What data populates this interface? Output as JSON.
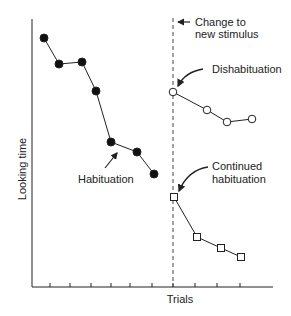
{
  "chart_data": {
    "type": "line",
    "title": "",
    "xlabel": "Trials",
    "ylabel": "Looking time",
    "grid": false,
    "legend": null,
    "x_ticks_count": 10,
    "x_tick_labels": [],
    "y_tick_labels": [],
    "series": [
      {
        "name": "Habituation (original stimulus)",
        "marker": "filled-circle",
        "x": [
          1,
          2,
          3,
          4,
          5,
          6,
          7
        ],
        "values": [
          38,
          64,
          62,
          91,
          142,
          152,
          174
        ]
      },
      {
        "name": "Dishabituation (new stimulus)",
        "marker": "open-circle",
        "x": [
          8,
          9,
          10,
          11
        ],
        "values": [
          92,
          110,
          122,
          119
        ]
      },
      {
        "name": "Continued habituation (same stimulus)",
        "marker": "open-square",
        "x": [
          8,
          9,
          10,
          11
        ],
        "values": [
          197,
          237,
          248,
          257
        ]
      }
    ],
    "value_note": "values are pixel y-positions (smaller = more looking time); axes unlabeled numerically",
    "annotations": [
      {
        "text_lines": [
          "Change to",
          "new stimulus"
        ],
        "target": "dashed vertical line at trial 8"
      },
      {
        "text_lines": [
          "Dishabituation"
        ],
        "target": "first open circle"
      },
      {
        "text_lines": [
          "Habituation"
        ],
        "target": "filled-circle descending series"
      },
      {
        "text_lines": [
          "Continued",
          "habituation"
        ],
        "target": "first open square"
      }
    ]
  },
  "labels": {
    "xlabel": "Trials",
    "ylabel": "Looking time",
    "change_line1": "Change to",
    "change_line2": "new stimulus",
    "dishabituation": "Dishabituation",
    "habituation": "Habituation",
    "continued_line1": "Continued",
    "continued_line2": "habituation"
  },
  "colors": {
    "ink": "#222222",
    "background": "#ffffff"
  }
}
